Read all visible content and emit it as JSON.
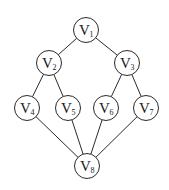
{
  "diagram": {
    "type": "directed-acyclic-graph",
    "nodes": [
      {
        "id": "V1",
        "base": "V",
        "sub": "1",
        "x": 86,
        "y": 30
      },
      {
        "id": "V2",
        "base": "V",
        "sub": "2",
        "x": 49,
        "y": 63
      },
      {
        "id": "V3",
        "base": "V",
        "sub": "3",
        "x": 127,
        "y": 63
      },
      {
        "id": "V4",
        "base": "V",
        "sub": "4",
        "x": 27,
        "y": 108
      },
      {
        "id": "V5",
        "base": "V",
        "sub": "5",
        "x": 68,
        "y": 108
      },
      {
        "id": "V6",
        "base": "V",
        "sub": "6",
        "x": 106,
        "y": 108
      },
      {
        "id": "V7",
        "base": "V",
        "sub": "7",
        "x": 146,
        "y": 108
      },
      {
        "id": "V8",
        "base": "V",
        "sub": "8",
        "x": 87,
        "y": 166
      }
    ],
    "edges": [
      {
        "from": "V1",
        "to": "V2"
      },
      {
        "from": "V1",
        "to": "V3"
      },
      {
        "from": "V2",
        "to": "V4"
      },
      {
        "from": "V2",
        "to": "V5"
      },
      {
        "from": "V3",
        "to": "V6"
      },
      {
        "from": "V3",
        "to": "V7"
      },
      {
        "from": "V4",
        "to": "V8"
      },
      {
        "from": "V5",
        "to": "V8"
      },
      {
        "from": "V6",
        "to": "V8"
      },
      {
        "from": "V7",
        "to": "V8"
      }
    ],
    "node_radius": 12.5,
    "colors": {
      "stroke": "#2a2a2a",
      "fill": "#ffffff",
      "text": "#1a1a1a"
    }
  }
}
